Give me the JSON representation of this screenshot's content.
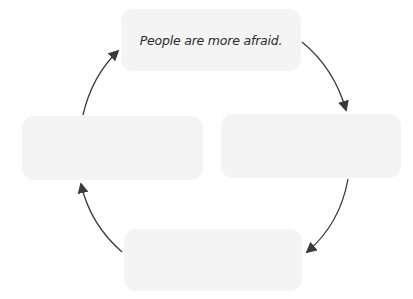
{
  "diagram": {
    "type": "cycle",
    "nodes": [
      {
        "id": "top",
        "label": "People are more afraid."
      },
      {
        "id": "right",
        "label": ""
      },
      {
        "id": "bottom",
        "label": ""
      },
      {
        "id": "left",
        "label": ""
      }
    ],
    "edges": [
      {
        "from": "top",
        "to": "right",
        "direction": "clockwise"
      },
      {
        "from": "right",
        "to": "bottom",
        "direction": "clockwise"
      },
      {
        "from": "bottom",
        "to": "left",
        "direction": "clockwise"
      },
      {
        "from": "left",
        "to": "top",
        "direction": "clockwise"
      }
    ],
    "colors": {
      "node_fill": "#f4f4f4",
      "arrow": "#3a3a3a",
      "text": "#2b2b2b",
      "background": "#ffffff"
    }
  }
}
